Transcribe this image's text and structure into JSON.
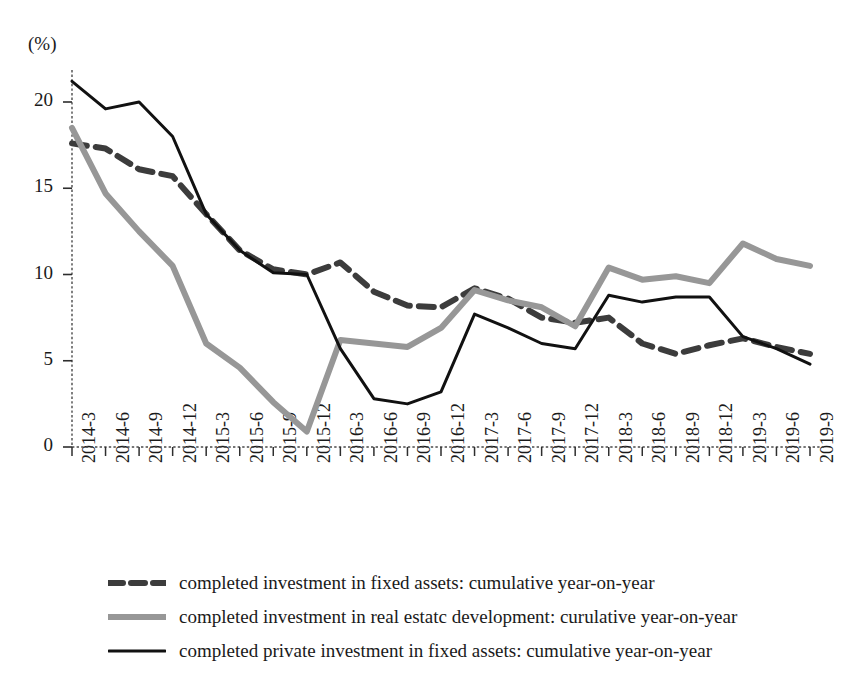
{
  "chart_data": {
    "type": "line",
    "title": "",
    "subtitle": "",
    "xlabel": "",
    "ylabel": "",
    "yunit": "(%)",
    "ylim": [
      0,
      22.5
    ],
    "yticks": [
      0,
      5,
      10,
      15,
      20
    ],
    "grid": false,
    "legend_position": "bottom",
    "categories": [
      "2014-3",
      "2014-6",
      "2014-9",
      "2014-12",
      "2015-3",
      "2015-6",
      "2015-9",
      "2015-12",
      "2016-3",
      "2016-6",
      "2016-9",
      "2016-12",
      "2017-3",
      "2017-6",
      "2017-9",
      "2017-12",
      "2018-3",
      "2018-6",
      "2018-9",
      "2018-12",
      "2019-3",
      "2019-6",
      "2019-9"
    ],
    "series": [
      {
        "name": "completed investment in fixed assets: cumulative year-on-year",
        "style": "dashed",
        "color": "#3c3c3c",
        "width": 6,
        "values": [
          17.6,
          17.3,
          16.1,
          15.7,
          13.5,
          11.4,
          10.3,
          10.0,
          10.7,
          9.0,
          8.2,
          8.1,
          9.2,
          8.6,
          7.5,
          7.2,
          7.5,
          6.0,
          5.4,
          5.9,
          6.3,
          5.8,
          5.4
        ]
      },
      {
        "name": "completed investment in real estatc development: curulative year-on-year",
        "style": "solid",
        "color": "#979797",
        "width": 6,
        "values": [
          18.5,
          14.7,
          12.5,
          10.5,
          6.0,
          4.6,
          2.6,
          0.9,
          6.2,
          6.0,
          5.8,
          6.9,
          9.1,
          8.5,
          8.1,
          7.0,
          10.4,
          9.7,
          9.9,
          9.5,
          11.8,
          10.9,
          10.5
        ]
      },
      {
        "name": "completed private investment in fixed assets: cumulative year-on-year",
        "style": "solid",
        "color": "#111111",
        "width": 3,
        "values": [
          21.2,
          19.6,
          20.0,
          18.0,
          13.5,
          11.4,
          10.1,
          10.0,
          5.7,
          2.8,
          2.5,
          3.2,
          7.7,
          6.9,
          6.0,
          5.7,
          8.8,
          8.4,
          8.7,
          8.7,
          6.4,
          5.7,
          4.8
        ]
      }
    ]
  },
  "legend": {
    "items": [
      {
        "label": "completed investment in fixed assets: cumulative year-on-year",
        "swatch": "dashed-dark-gray"
      },
      {
        "label": "completed investment in real estatc development: curulative year-on-year",
        "swatch": "solid-gray-thick"
      },
      {
        "label": "completed private investment in fixed assets: cumulative year-on-year",
        "swatch": "solid-black-thin"
      }
    ]
  }
}
